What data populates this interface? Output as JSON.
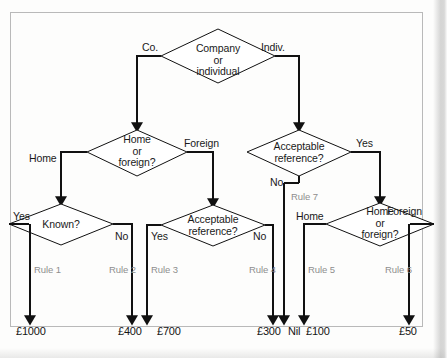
{
  "figure": {
    "kind": "decision-flowchart",
    "frame_color": "#b9b9b9",
    "line_color": "#111111",
    "rule_color": "#8e8e8e",
    "text_color": "#1a1a1a"
  },
  "nodes": {
    "root": {
      "id": "company-or-individual",
      "text_lines": [
        "Company",
        "or",
        "individual"
      ]
    },
    "home_or_foreign_left": {
      "id": "home-or-foreign-left",
      "text_lines": [
        "Home",
        "or",
        "foreign?"
      ]
    },
    "acceptable_reference_top": {
      "id": "acceptable-reference-top",
      "text_lines": [
        "Acceptable",
        "reference?"
      ]
    },
    "known": {
      "id": "known",
      "text_lines": [
        "Known?"
      ]
    },
    "acceptable_reference_bottom": {
      "id": "acceptable-reference-bottom",
      "text_lines": [
        "Acceptable",
        "reference?"
      ]
    },
    "home_or_foreign_right": {
      "id": "home-or-foreign-right",
      "text_lines": [
        "Home",
        "or",
        "foreign?"
      ]
    }
  },
  "branch_labels": {
    "co": "Co.",
    "indiv": "Indiv.",
    "home_left": "Home",
    "foreign_left": "Foreign",
    "yes_ref_top": "Yes",
    "no_ref_top": "No",
    "yes_known": "Yes",
    "no_known": "No",
    "yes_ref_bottom": "Yes",
    "no_ref_bottom": "No",
    "home_right": "Home",
    "foreign_right": "Foreign"
  },
  "rules": {
    "rule1": "Rule 1",
    "rule2": "Rule 2",
    "rule3": "Rule 3",
    "rule4": "Rule 4",
    "rule5": "Rule 5",
    "rule6": "Rule 6",
    "rule7": "Rule 7"
  },
  "outcomes": {
    "o1": "£1000",
    "o2": "£400",
    "o3": "£700",
    "o4": "£300",
    "o5": "Nil",
    "o6": "£100",
    "o7": "£50"
  }
}
